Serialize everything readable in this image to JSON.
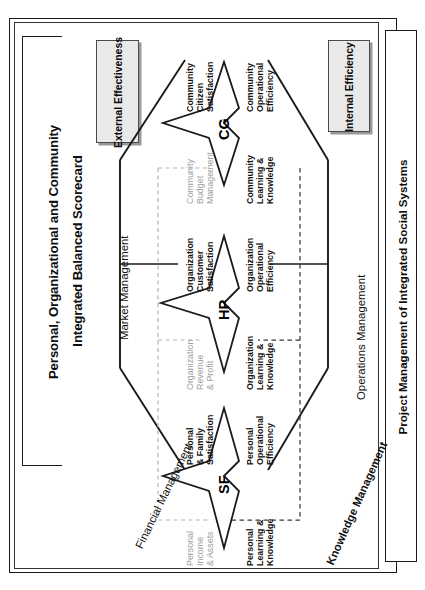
{
  "title": {
    "line1": "Personal, Organizational and Community",
    "line2": "Integrated Balanced Scorecard",
    "full": "Personal, Organizational and Community Integrated Balanced Scorecard"
  },
  "caption": "Project Management of Integrated Social Systems",
  "legends": [
    {
      "id": "external",
      "line1": "External",
      "line2": "Effectiveness",
      "fill": "#e9e9e9",
      "border": "#4a4a4a"
    },
    {
      "id": "internal",
      "line1": "Internal",
      "line2": "Efficiency",
      "fill": "#e9e9e9",
      "border": "#4a4a4a"
    }
  ],
  "edge_labels": [
    {
      "id": "market-management",
      "text": "Market Management",
      "bold": false
    },
    {
      "id": "operations-management",
      "text": "Operations Management",
      "bold": false
    },
    {
      "id": "financial-management",
      "text": "Financial Management",
      "bold": false
    },
    {
      "id": "knowledge-management",
      "text": "Knowledge Management",
      "bold": true
    }
  ],
  "levels": [
    {
      "id": "community",
      "abbr": "CG",
      "quadrants": {
        "top_left": {
          "lines": [
            "Community",
            "Citizen",
            "Satisfaction"
          ],
          "style": "dark"
        },
        "top_right": {
          "lines": [
            "Community",
            "Operational",
            "Efficiency"
          ],
          "style": "dark"
        },
        "bottom_left": {
          "lines": [
            "Community",
            "Budget",
            "Management"
          ],
          "style": "grey"
        },
        "bottom_right": {
          "lines": [
            "Community",
            "Learning &",
            "Knowledge"
          ],
          "style": "dark"
        }
      }
    },
    {
      "id": "organization",
      "abbr": "HP",
      "quadrants": {
        "top_left": {
          "lines": [
            "Organization",
            "Customer",
            "Satisfaction"
          ],
          "style": "dark"
        },
        "top_right": {
          "lines": [
            "Organization",
            "Operational",
            "Efficiency"
          ],
          "style": "dark"
        },
        "bottom_left": {
          "lines": [
            "Organization",
            "Revenue",
            "& Profit"
          ],
          "style": "grey"
        },
        "bottom_right": {
          "lines": [
            "Organization",
            "Learning &",
            "Knowledge"
          ],
          "style": "dark"
        }
      }
    },
    {
      "id": "personal",
      "abbr": "SF",
      "quadrants": {
        "top_left": {
          "lines": [
            "Personal",
            "& Family",
            "Satisfaction"
          ],
          "style": "dark"
        },
        "top_right": {
          "lines": [
            "Personal",
            "Operational",
            "Efficiency"
          ],
          "style": "dark"
        },
        "bottom_left": {
          "lines": [
            "Personal",
            "Income",
            "& Assets"
          ],
          "style": "grey"
        },
        "bottom_right": {
          "lines": [
            "Personal",
            "Learning &",
            "Knowledge"
          ],
          "style": "dark"
        }
      }
    }
  ],
  "colors": {
    "stroke": "#1a1a1a",
    "grey_text": "#9d9d9d",
    "dark_text": "#111111",
    "legend_fill": "#e9e9e9",
    "background": "#ffffff"
  },
  "orientation": "rotated-90-counterclockwise"
}
